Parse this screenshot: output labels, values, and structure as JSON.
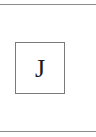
{
  "tile": {
    "letter": "J"
  },
  "colors": {
    "rule": "#8c8c8c",
    "tile_border": "#7a7a7a",
    "letter": "#1a1a1a",
    "background": "#ffffff"
  }
}
